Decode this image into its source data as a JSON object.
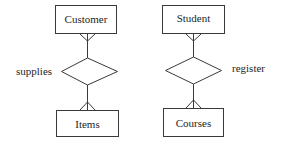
{
  "diagram": {
    "type": "er-diagram",
    "entities": [
      {
        "id": "customer",
        "label": "Customer"
      },
      {
        "id": "items",
        "label": "Items"
      },
      {
        "id": "student",
        "label": "Student"
      },
      {
        "id": "courses",
        "label": "Courses"
      }
    ],
    "relationships": [
      {
        "id": "supplies",
        "label": "supplies",
        "from": "Customer",
        "to": "Items",
        "cardinality": "many-to-many"
      },
      {
        "id": "register",
        "label": "register",
        "from": "Student",
        "to": "Courses",
        "cardinality": "many-to-many"
      }
    ],
    "colors": {
      "line": "#3a3a3a",
      "text": "#1e1e1e",
      "background": "#ffffff"
    }
  }
}
